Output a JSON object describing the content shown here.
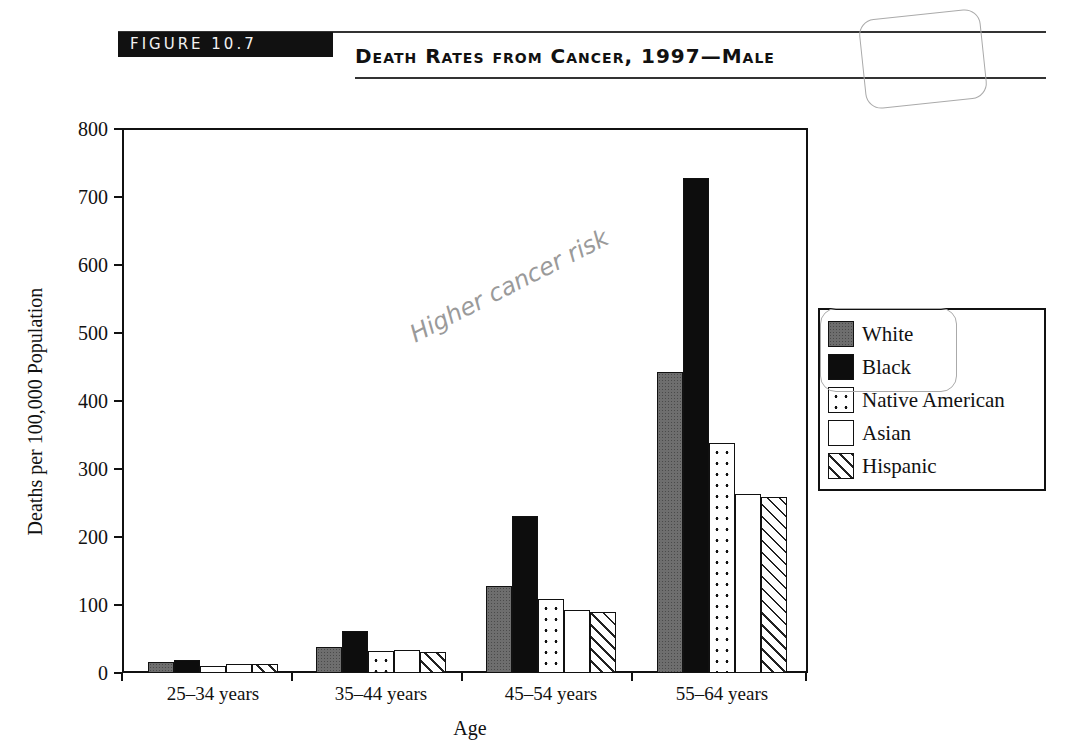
{
  "header": {
    "figure_label": "FIGURE 10.7",
    "title": "Death Rates from Cancer, 1997—Male"
  },
  "annotation": {
    "handwritten_note": "Higher cancer risk"
  },
  "axes": {
    "ylabel": "Deaths per 100,000 Population",
    "xlabel": "Age",
    "yticks": [
      "800",
      "700",
      "600",
      "500",
      "400",
      "300",
      "200",
      "100",
      "0"
    ],
    "xticks": [
      "25–34 years",
      "35–44 years",
      "45–54 years",
      "55–64 years"
    ]
  },
  "legend": {
    "items": [
      {
        "label": "White",
        "pattern": "gray-stipple"
      },
      {
        "label": "Black",
        "pattern": "solid-black"
      },
      {
        "label": "Native American",
        "pattern": "dots"
      },
      {
        "label": "Asian",
        "pattern": "white"
      },
      {
        "label": "Hispanic",
        "pattern": "diagonal-hatch"
      }
    ]
  },
  "chart_data": {
    "type": "bar",
    "title": "Death Rates from Cancer, 1997—Male",
    "xlabel": "Age",
    "ylabel": "Deaths per 100,000 Population",
    "ylim": [
      0,
      800
    ],
    "yticks": [
      0,
      100,
      200,
      300,
      400,
      500,
      600,
      700,
      800
    ],
    "grid": false,
    "legend_position": "right",
    "categories": [
      "25–34 years",
      "35–44 years",
      "45–54 years",
      "55–64 years"
    ],
    "series": [
      {
        "name": "White",
        "values": [
          16,
          38,
          128,
          443
        ]
      },
      {
        "name": "Black",
        "values": [
          19,
          62,
          231,
          728
        ]
      },
      {
        "name": "Native American",
        "values": [
          11,
          32,
          109,
          338
        ]
      },
      {
        "name": "Asian",
        "values": [
          13,
          34,
          93,
          263
        ]
      },
      {
        "name": "Hispanic",
        "values": [
          13,
          31,
          90,
          259
        ]
      }
    ]
  }
}
